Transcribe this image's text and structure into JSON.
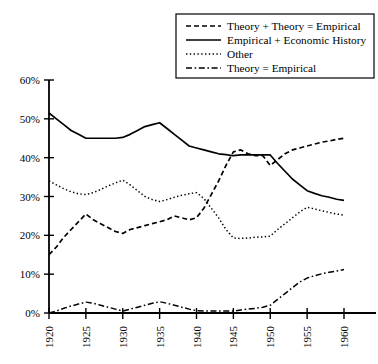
{
  "chart_data": {
    "type": "line",
    "title": "",
    "xlabel": "",
    "ylabel": "",
    "xlim": [
      1920,
      1960
    ],
    "ylim": [
      0,
      60
    ],
    "grid": false,
    "legend_position": "top-right",
    "x": [
      1920,
      1921,
      1922,
      1923,
      1924,
      1925,
      1926,
      1927,
      1928,
      1929,
      1930,
      1931,
      1932,
      1933,
      1934,
      1935,
      1936,
      1937,
      1938,
      1939,
      1940,
      1941,
      1942,
      1943,
      1944,
      1945,
      1946,
      1947,
      1948,
      1949,
      1950,
      1951,
      1952,
      1953,
      1954,
      1955,
      1956,
      1957,
      1958,
      1959,
      1960
    ],
    "xticks": [
      1920,
      1925,
      1930,
      1935,
      1940,
      1945,
      1950,
      1955,
      1960
    ],
    "xtick_labels": [
      "1920",
      "1925",
      "1930",
      "1935",
      "1940",
      "1945",
      "1950",
      "1955",
      "1960"
    ],
    "yticks": [
      0,
      10,
      20,
      30,
      40,
      50,
      60
    ],
    "ytick_labels": [
      "0%",
      "10%",
      "20%",
      "30%",
      "40%",
      "50%",
      "60%"
    ],
    "series": [
      {
        "name": "Theory + Theory = Empirical",
        "style": "dashed",
        "values": [
          15.0,
          17.0,
          19.5,
          21.5,
          23.5,
          25.5,
          24.0,
          23.0,
          22.0,
          21.0,
          20.5,
          21.5,
          22.0,
          22.5,
          23.0,
          23.5,
          24.0,
          25.0,
          24.5,
          24.0,
          24.5,
          27.0,
          30.5,
          34.0,
          38.0,
          41.5,
          42.0,
          41.0,
          40.5,
          40.5,
          38.0,
          39.5,
          41.0,
          42.0,
          42.5,
          43.0,
          43.5,
          44.0,
          44.3,
          44.7,
          45.0
        ]
      },
      {
        "name": "Empirical + Economic History",
        "style": "solid",
        "values": [
          51.5,
          50.0,
          48.5,
          47.0,
          46.0,
          45.0,
          45.0,
          45.0,
          45.0,
          45.0,
          45.2,
          46.0,
          47.0,
          48.0,
          48.5,
          49.0,
          47.5,
          46.0,
          44.5,
          43.0,
          42.5,
          42.0,
          41.5,
          41.0,
          40.8,
          40.5,
          40.7,
          40.7,
          40.7,
          40.7,
          40.7,
          38.5,
          36.5,
          34.5,
          33.0,
          31.5,
          30.8,
          30.2,
          29.8,
          29.3,
          29.0
        ]
      },
      {
        "name": "Other",
        "style": "dotted",
        "values": [
          34.0,
          33.0,
          32.0,
          31.2,
          30.7,
          30.5,
          31.0,
          31.8,
          32.7,
          33.5,
          34.2,
          33.0,
          31.5,
          30.0,
          29.2,
          28.7,
          29.2,
          29.8,
          30.3,
          30.7,
          31.0,
          29.5,
          27.0,
          24.5,
          21.5,
          19.3,
          19.2,
          19.3,
          19.5,
          19.6,
          19.8,
          21.5,
          23.0,
          24.5,
          26.0,
          27.2,
          26.8,
          26.3,
          25.9,
          25.5,
          25.2
        ]
      },
      {
        "name": "Theory = Empirical",
        "style": "dash-dot",
        "values": [
          0.0,
          0.5,
          1.2,
          1.8,
          2.3,
          2.8,
          2.5,
          2.0,
          1.5,
          1.0,
          0.5,
          1.0,
          1.5,
          2.0,
          2.5,
          2.9,
          2.5,
          2.0,
          1.5,
          1.0,
          0.6,
          0.5,
          0.5,
          0.5,
          0.5,
          0.5,
          0.8,
          1.0,
          1.2,
          1.5,
          2.0,
          3.5,
          5.0,
          6.5,
          8.0,
          9.0,
          9.6,
          10.1,
          10.5,
          10.8,
          11.2
        ]
      }
    ]
  },
  "legend": {
    "items": [
      {
        "label": "Theory + Theory = Empirical",
        "style": "dashed"
      },
      {
        "label": "Empirical + Economic History",
        "style": "solid"
      },
      {
        "label": "Other",
        "style": "dotted"
      },
      {
        "label": "Theory = Empirical",
        "style": "dash-dot"
      }
    ]
  }
}
